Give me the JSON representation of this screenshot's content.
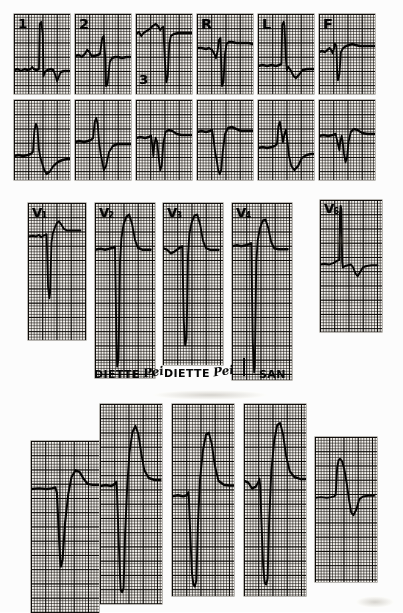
{
  "document": {
    "type": "electrocardiogram",
    "title": "12-lead electrocardiogram tracing",
    "background_color": "#fdfdfb",
    "paper_color": "#f4f2ee",
    "ink_color": "#0b0a09",
    "grid_fine_mm": 1,
    "grid_bold_mm": 5
  },
  "markings": {
    "brand_text_1": "DIETTE",
    "brand_script_1": "Pei",
    "brand_text_2": "DIETTE",
    "brand_script_2": "Pei",
    "brand_text_3": "SAN"
  },
  "sections": [
    {
      "id": "limb-leads-row-1",
      "name": "Limb and augmented leads — first row",
      "strips": [
        {
          "label": "1",
          "label_sub": "",
          "x": 14,
          "y": 14,
          "w": 56,
          "h": 80,
          "label_x": 4,
          "label_y": 3,
          "label_size": 13,
          "path": "M0,56 L5,55 L9,57 L14,55 L18,56 L22,55 L24,53 L26,55 L30,56 L33,55 L34,10 L36,8 L38,20 L39,62 L41,58 L44,56 L49,55 L52,56 L55,62 L57,67 L59,63 L62,58 L66,57 L70,57 L74,57"
        },
        {
          "label": "2",
          "label_sub": "",
          "x": 75,
          "y": 14,
          "w": 56,
          "h": 80,
          "label_x": 4,
          "label_y": 3,
          "label_size": 14,
          "path": "M0,42 L5,41 L9,43 L13,40 L16,36 L19,38 L22,42 L26,42 L30,41 L33,40 L36,24 L38,22 L40,44 L41,72 L43,70 L46,48 L49,44 L53,43 L57,43 L62,44 L68,43 L74,43"
        },
        {
          "label": "3",
          "label_sub": "",
          "x": 136,
          "y": 14,
          "w": 56,
          "h": 80,
          "label_x": 3,
          "label_y": 59,
          "label_size": 13,
          "path": "M0,20 L4,18 L7,22 L10,19 L14,17 L18,15 L22,12 L26,10 L29,12 L32,16 L34,14 L36,13 L38,44 L40,68 L42,62 L44,30 L46,22 L50,20 L56,19 L62,19 L68,19 L74,19"
        },
        {
          "label": "R",
          "label_sub": "",
          "x": 197,
          "y": 14,
          "w": 56,
          "h": 80,
          "label_x": 4,
          "label_y": 3,
          "label_size": 14,
          "path": "M0,34 L6,34 L12,35 L16,34 L20,36 L23,40 L25,44 L27,38 L29,26 L31,24 L32,50 L33,72 L35,68 L37,40 L39,30 L42,28 L46,28 L52,29 L60,29 L68,29 L74,30"
        },
        {
          "label": "L",
          "label_sub": "",
          "x": 258,
          "y": 14,
          "w": 56,
          "h": 80,
          "label_x": 4,
          "label_y": 3,
          "label_size": 14,
          "path": "M0,52 L6,51 L12,52 L18,51 L24,52 L28,51 L31,50 L32,11 L34,8 L35,12 L37,46 L38,56 L40,53 L43,56 L47,62 L50,64 L54,61 L59,56 L65,55 L70,55 L74,55"
        },
        {
          "label": "F",
          "label_sub": "",
          "x": 319,
          "y": 14,
          "w": 56,
          "h": 80,
          "label_x": 4,
          "label_y": 3,
          "label_size": 14,
          "path": "M0,38 L4,37 L8,38 L11,36 L14,34 L16,36 L18,39 L20,34 L21,30 L23,32 L24,58 L25,66 L27,60 L29,38 L32,34 L36,32 L40,31 L44,30 L48,31 L54,32 L60,32 L66,32 L74,32"
        }
      ]
    },
    {
      "id": "limb-leads-row-2",
      "name": "Limb and augmented leads — second row",
      "strips": [
        {
          "label": "",
          "label_sub": "",
          "x": 14,
          "y": 100,
          "w": 56,
          "h": 80,
          "label_x": 0,
          "label_y": 0,
          "label_size": 0,
          "path": "M0,56 L6,55 L12,56 L18,55 L22,54 L25,52 L27,30 L29,24 L31,28 L33,50 L35,58 L37,63 L40,70 L43,74 L47,72 L52,66 L58,62 L64,60 L70,59 L74,59"
        },
        {
          "label": "",
          "label_sub": "",
          "x": 75,
          "y": 100,
          "w": 56,
          "h": 80,
          "label_x": 0,
          "label_y": 0,
          "label_size": 0,
          "path": "M0,42 L6,41 L12,42 L17,41 L21,40 L24,38 L26,22 L28,18 L30,24 L32,44 L34,54 L36,62 L38,70 L41,66 L45,52 L50,46 L56,44 L62,44 L68,44 L74,44"
        },
        {
          "label": "",
          "label_sub": "",
          "x": 136,
          "y": 100,
          "w": 56,
          "h": 80,
          "label_x": 0,
          "label_y": 0,
          "label_size": 0,
          "path": "M0,38 L6,37 L12,38 L17,37 L20,36 L22,48 L23,56 L24,46 L26,38 L28,42 L30,58 L32,70 L34,66 L36,44 L39,32 L43,30 L48,31 L54,34 L60,35 L67,35 L74,35"
        },
        {
          "label": "",
          "label_sub": "",
          "x": 197,
          "y": 100,
          "w": 56,
          "h": 80,
          "label_x": 0,
          "label_y": 0,
          "label_size": 0,
          "path": "M0,32 L6,31 L12,32 L17,31 L20,30 L22,40 L24,52 L26,60 L28,70 L30,74 L32,70 L34,52 L37,34 L41,28 L46,27 L52,29 L58,31 L65,31 L74,31"
        },
        {
          "label": "",
          "label_sub": "",
          "x": 258,
          "y": 100,
          "w": 56,
          "h": 80,
          "label_x": 0,
          "label_y": 0,
          "label_size": 0,
          "path": "M0,48 L6,47 L12,48 L18,47 L22,46 L25,44 L27,26 L29,22 L31,32 L33,42 L35,34 L37,30 L39,42 L41,56 L44,66 L48,70 L53,66 L58,58 L64,55 L70,54 L74,54"
        },
        {
          "label": "",
          "label_sub": "",
          "x": 319,
          "y": 100,
          "w": 56,
          "h": 80,
          "label_x": 0,
          "label_y": 0,
          "label_size": 0,
          "path": "M0,36 L6,35 L12,36 L18,35 L22,34 L25,44 L27,50 L28,42 L30,36 L31,40 L33,54 L35,62 L37,58 L39,42 L42,32 L46,29 L51,30 L57,33 L64,34 L74,34"
        }
      ]
    },
    {
      "id": "precordial-leads",
      "name": "Precordial chest leads V1-V6",
      "strips": [
        {
          "label": "V",
          "label_sub": "1",
          "x": 28,
          "y": 203,
          "w": 58,
          "h": 137,
          "label_x": 4,
          "label_y": 3,
          "label_size": 13,
          "path": "M0,44 L7,43 L12,44 L16,42 L19,45 L22,43 L25,42 L27,41 L29,110 L31,125 L32,118 L34,52 L36,40 L39,32 L42,26 L45,24 L48,28 L52,34 L56,36 L62,36 L68,36 L76,36"
        },
        {
          "label": "V",
          "label_sub": "2",
          "x": 95,
          "y": 203,
          "w": 60,
          "h": 175,
          "label_x": 4,
          "label_y": 3,
          "label_size": 13,
          "path": "M0,48 L8,47 L14,48 L20,47 L25,46 L28,45 L30,140 L31,168 L33,160 L35,60 L37,36 L40,22 L44,14 L48,12 L52,22 L56,38 L60,46 L66,48 L72,48 L78,48"
        },
        {
          "label": "V",
          "label_sub": "3",
          "x": 163,
          "y": 203,
          "w": 60,
          "h": 162,
          "label_x": 4,
          "label_y": 3,
          "label_size": 13,
          "path": "M0,50 L6,52 L11,56 L16,54 L21,51 L25,49 L27,48 L29,130 L31,158 L33,150 L35,58 L37,34 L40,22 L44,14 L48,13 L52,24 L56,42 L60,50 L66,52 L72,52 L78,52"
        },
        {
          "label": "V",
          "label_sub": "4",
          "x": 232,
          "y": 203,
          "w": 60,
          "h": 177,
          "label_x": 4,
          "label_y": 3,
          "label_size": 13,
          "path": "M0,44 L7,43 L13,44 L19,43 L24,42 L27,41 L29,140 L31,172 L32,166 L34,60 L36,38 L39,26 L43,18 L47,17 L51,26 L55,40 L59,46 L65,47 L71,47 L78,47"
        },
        {
          "label": "V",
          "label_sub": "6",
          "x": 320,
          "y": 200,
          "w": 62,
          "h": 132,
          "label_x": 4,
          "label_y": 2,
          "label_size": 13,
          "path": "M0,88 L6,87 L12,88 L18,86 L23,83 L26,82 L27,20 L28,8 L29,14 L30,84 L31,92 L34,90 L38,89 L42,88 L45,92 L48,100 L51,104 L54,99 L58,92 L63,90 L70,89 L78,89"
        }
      ]
    },
    {
      "id": "lower-strips",
      "name": "Additional precordial tracings — lower row",
      "strips": [
        {
          "label": "",
          "label_sub": "",
          "x": 31,
          "y": 441,
          "w": 68,
          "h": 172,
          "label_x": 0,
          "label_y": 0,
          "label_size": 0,
          "path": "M0,56 L10,55 L19,56 L26,55 L30,54 L32,60 L34,100 L36,138 L37,146 L39,138 L42,96 L46,62 L50,42 L55,34 L60,36 L65,44 L70,50 L76,51 L84,51"
        },
        {
          "label": "",
          "label_sub": "",
          "x": 100,
          "y": 404,
          "w": 62,
          "h": 200,
          "label_x": 0,
          "label_y": 0,
          "label_size": 0,
          "path": "M0,82 L8,81 L15,82 L20,80 L22,78 L23,86 L25,130 L27,170 L28,186 L30,188 L32,184 L34,130 L37,80 L40,48 L44,28 L48,22 L52,30 L56,50 L60,66 L66,74 L74,76 L82,76"
        },
        {
          "label": "",
          "label_sub": "",
          "x": 172,
          "y": 404,
          "w": 62,
          "h": 192,
          "label_x": 0,
          "label_y": 0,
          "label_size": 0,
          "path": "M0,96 L8,95 L15,96 L20,95 L22,92 L23,100 L25,140 L27,176 L29,188 L31,190 L33,184 L35,128 L38,78 L42,48 L46,32 L50,30 L54,42 L58,64 L63,80 L70,84 L78,85 L84,85"
        },
        {
          "label": "",
          "label_sub": "",
          "x": 244,
          "y": 404,
          "w": 62,
          "h": 192,
          "label_x": 0,
          "label_y": 0,
          "label_size": 0,
          "path": "M0,80 L6,82 L11,88 L16,86 L19,82 L21,78 L22,86 L24,130 L26,170 L28,186 L30,188 L32,182 L34,124 L37,70 L41,38 L45,22 L49,20 L53,32 L57,54 L62,70 L68,76 L76,78 L84,78"
        },
        {
          "label": "",
          "label_sub": "",
          "x": 315,
          "y": 437,
          "w": 62,
          "h": 145,
          "label_x": 0,
          "label_y": 0,
          "label_size": 0,
          "path": "M0,84 L8,83 L16,84 L22,83 L26,82 L28,80 L30,42 L32,32 L34,30 L37,34 L40,46 L43,64 L46,86 L49,104 L52,108 L56,100 L60,86 L65,82 L72,81 L80,81"
        }
      ]
    }
  ]
}
